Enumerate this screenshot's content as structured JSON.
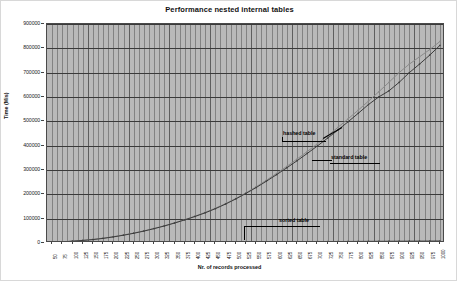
{
  "chart_data": {
    "type": "line",
    "title": "Performance nested internal tables",
    "xlabel": "Nr. of records processed",
    "ylabel": "Time (Mis)",
    "ylim": [
      0,
      900000
    ],
    "ytick_values": [
      0,
      100000,
      200000,
      300000,
      400000,
      500000,
      600000,
      700000,
      800000,
      900000
    ],
    "ytick_labels": [
      "0",
      "100000",
      "200000",
      "300000",
      "400000",
      "500000",
      "600000",
      "700000",
      "800000",
      "900000"
    ],
    "grid": true,
    "legend_position": "inline-annotations",
    "x": [
      50,
      75,
      100,
      125,
      150,
      175,
      200,
      225,
      250,
      275,
      300,
      325,
      350,
      375,
      400,
      425,
      450,
      475,
      500,
      525,
      550,
      575,
      600,
      625,
      650,
      675,
      700,
      725,
      750,
      775,
      800,
      825,
      850,
      875,
      900,
      925,
      950,
      975,
      1000
    ],
    "xtick_labels": [
      "50",
      "75",
      "100",
      "125",
      "150",
      "175",
      "200",
      "225",
      "250",
      "275",
      "300",
      "325",
      "350",
      "375",
      "400",
      "425",
      "450",
      "475",
      "500",
      "525",
      "550",
      "575",
      "600",
      "625",
      "650",
      "675",
      "700",
      "725",
      "750",
      "775",
      "800",
      "825",
      "850",
      "875",
      "900",
      "925",
      "950",
      "975",
      "1000"
    ],
    "series": [
      {
        "name": "hashed table",
        "color": "#8a8a8a",
        "values": [
          3000,
          5000,
          8000,
          11000,
          15000,
          20000,
          26000,
          33000,
          41000,
          50000,
          60000,
          71000,
          83000,
          96000,
          110000,
          126000,
          143000,
          162000,
          183000,
          206000,
          231000,
          258000,
          286000,
          315000,
          345000,
          376000,
          408000,
          441000,
          475000,
          510000,
          546000,
          583000,
          621000,
          660000,
          700000,
          735000,
          765000,
          795000,
          828000
        ]
      },
      {
        "name": "standard table",
        "color": "#3c3c3c",
        "values": [
          2500,
          4500,
          7500,
          10500,
          14000,
          19000,
          25000,
          32000,
          40000,
          49000,
          59000,
          70000,
          82000,
          95000,
          109000,
          124000,
          141000,
          160000,
          181000,
          204000,
          228000,
          254000,
          281000,
          309000,
          338000,
          368000,
          399000,
          431000,
          464000,
          498000,
          533000,
          569000,
          600000,
          625000,
          660000,
          700000,
          735000,
          772000,
          812000
        ]
      },
      {
        "name": "sorted table",
        "color": "#3c3c3c",
        "values": [
          500,
          700,
          900,
          1100,
          1300,
          1500,
          1700,
          1900,
          2100,
          2300,
          2500,
          2700,
          2900,
          3100,
          3300,
          3500,
          3700,
          3900,
          4100,
          4300,
          4500,
          4700,
          4900,
          5100,
          5300,
          5500,
          5700,
          5900,
          6100,
          6300,
          6500,
          6700,
          6900,
          7100,
          7300,
          7500,
          7700,
          7900,
          8100
        ]
      }
    ],
    "annotations": [
      {
        "text": "hashed table",
        "series": "hashed table"
      },
      {
        "text": "standard table",
        "series": "standard table"
      },
      {
        "text": "sorted table",
        "series": "sorted table"
      }
    ]
  }
}
